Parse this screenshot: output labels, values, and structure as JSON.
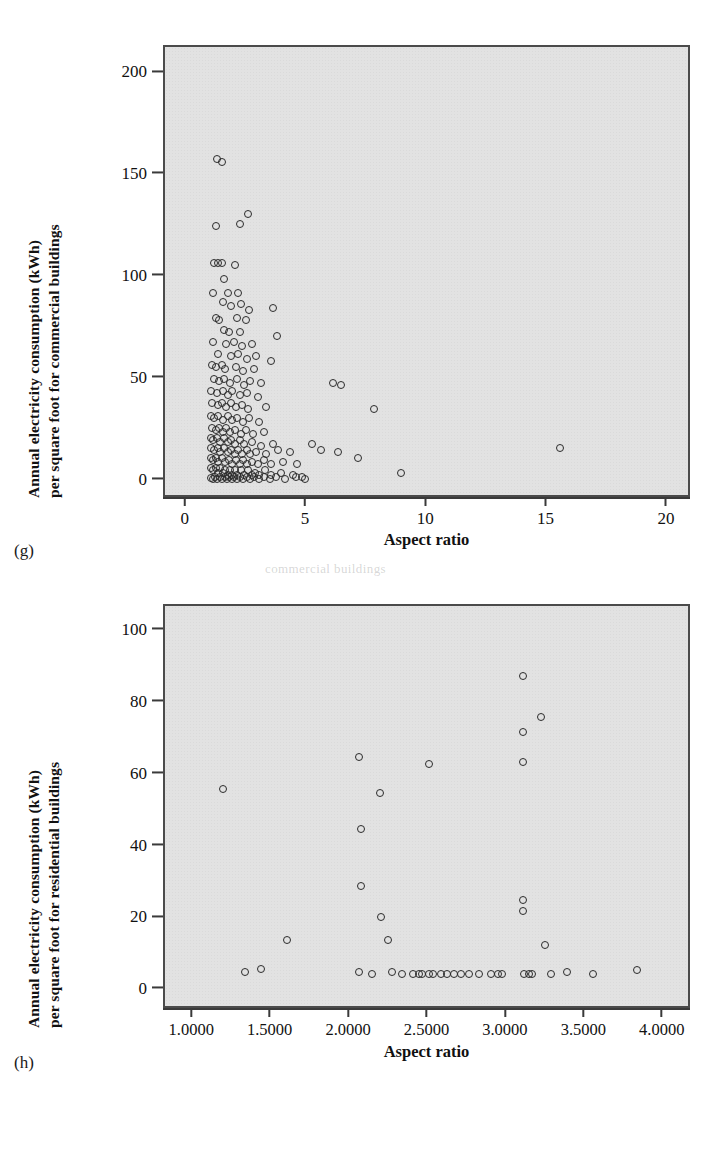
{
  "figures": [
    {
      "panel_label": "(g)",
      "ytitle_line1": "Annual electricity consumption (kWh)",
      "ytitle_line2": "per square foot for commercial buildings",
      "xtitle": "Aspect ratio",
      "yticks": [
        "0",
        "50",
        "100",
        "150",
        "200"
      ],
      "xticks": [
        "0",
        "5",
        "10",
        "15",
        "20"
      ]
    },
    {
      "panel_label": "(h)",
      "ytitle_line1": "Annual electricity consumption (kWh)",
      "ytitle_line2": "per square foot for residential buildings",
      "xtitle": "Aspect ratio",
      "yticks": [
        "0",
        "20",
        "40",
        "60",
        "80",
        "100"
      ],
      "xticks": [
        "1.0000",
        "1.5000",
        "2.0000",
        "2.5000",
        "3.0000",
        "3.5000",
        "4.0000"
      ]
    }
  ],
  "ghost_text": "commercial buildings",
  "chart_data": [
    {
      "type": "scatter",
      "panel": "(g)",
      "title": "",
      "xlabel": "Aspect ratio",
      "ylabel": "Annual electricity consumption (kWh) per square foot for commercial buildings",
      "xlim": [
        -0.9,
        21.0
      ],
      "ylim": [
        -9,
        213
      ],
      "xticks": [
        0,
        5,
        10,
        15,
        20
      ],
      "yticks": [
        0,
        50,
        100,
        150,
        200
      ],
      "grid": false,
      "legend": "none",
      "marker": "open-circle",
      "points": [
        [
          1.25,
          158
        ],
        [
          1.45,
          156.5
        ],
        [
          1.2,
          125
        ],
        [
          2.2,
          126
        ],
        [
          2.55,
          131
        ],
        [
          1.15,
          107
        ],
        [
          1.3,
          107
        ],
        [
          1.45,
          107
        ],
        [
          2.0,
          106
        ],
        [
          1.55,
          99
        ],
        [
          1.1,
          92
        ],
        [
          1.7,
          92
        ],
        [
          2.15,
          92
        ],
        [
          1.5,
          88
        ],
        [
          1.85,
          86
        ],
        [
          2.25,
          87
        ],
        [
          2.6,
          84
        ],
        [
          3.6,
          85
        ],
        [
          1.2,
          80
        ],
        [
          1.35,
          79
        ],
        [
          2.1,
          80
        ],
        [
          2.45,
          79
        ],
        [
          1.55,
          74
        ],
        [
          1.75,
          73
        ],
        [
          2.2,
          73
        ],
        [
          3.75,
          71
        ],
        [
          1.1,
          68
        ],
        [
          1.65,
          67
        ],
        [
          1.95,
          68
        ],
        [
          2.3,
          66
        ],
        [
          2.7,
          67
        ],
        [
          1.3,
          62
        ],
        [
          1.85,
          61
        ],
        [
          2.15,
          62
        ],
        [
          2.5,
          60
        ],
        [
          2.9,
          61
        ],
        [
          3.5,
          59
        ],
        [
          1.05,
          57
        ],
        [
          1.2,
          56
        ],
        [
          1.45,
          57
        ],
        [
          1.6,
          55
        ],
        [
          2.05,
          56
        ],
        [
          2.35,
          54
        ],
        [
          2.8,
          55
        ],
        [
          1.15,
          50
        ],
        [
          1.35,
          49
        ],
        [
          1.55,
          50
        ],
        [
          1.8,
          48
        ],
        [
          2.1,
          50
        ],
        [
          2.4,
          47
        ],
        [
          2.65,
          49
        ],
        [
          3.1,
          48
        ],
        [
          6.1,
          48
        ],
        [
          6.4,
          47
        ],
        [
          1.0,
          44
        ],
        [
          1.25,
          43
        ],
        [
          1.5,
          44
        ],
        [
          1.7,
          42
        ],
        [
          1.9,
          44
        ],
        [
          2.2,
          42
        ],
        [
          2.5,
          43
        ],
        [
          2.95,
          41
        ],
        [
          7.8,
          35
        ],
        [
          1.05,
          38
        ],
        [
          1.3,
          37
        ],
        [
          1.45,
          38
        ],
        [
          1.65,
          36
        ],
        [
          1.85,
          38
        ],
        [
          2.05,
          36
        ],
        [
          2.3,
          37
        ],
        [
          2.55,
          35
        ],
        [
          3.3,
          36
        ],
        [
          1.0,
          32
        ],
        [
          1.15,
          31
        ],
        [
          1.3,
          32
        ],
        [
          1.5,
          30
        ],
        [
          1.7,
          32
        ],
        [
          1.9,
          30
        ],
        [
          2.1,
          31
        ],
        [
          2.35,
          29
        ],
        [
          2.6,
          31
        ],
        [
          3.0,
          29
        ],
        [
          1.05,
          26
        ],
        [
          1.2,
          25
        ],
        [
          1.35,
          26
        ],
        [
          1.5,
          24
        ],
        [
          1.65,
          26
        ],
        [
          1.8,
          24
        ],
        [
          2.0,
          25
        ],
        [
          2.25,
          23
        ],
        [
          2.45,
          25
        ],
        [
          2.75,
          23
        ],
        [
          3.2,
          24
        ],
        [
          1.0,
          21
        ],
        [
          1.1,
          20
        ],
        [
          1.25,
          21
        ],
        [
          1.4,
          19
        ],
        [
          1.55,
          21
        ],
        [
          1.7,
          19
        ],
        [
          1.85,
          20
        ],
        [
          2.0,
          18
        ],
        [
          2.2,
          20
        ],
        [
          2.4,
          18
        ],
        [
          2.7,
          19
        ],
        [
          3.1,
          17
        ],
        [
          3.6,
          18
        ],
        [
          5.2,
          18
        ],
        [
          1.0,
          16
        ],
        [
          1.15,
          15
        ],
        [
          1.3,
          16
        ],
        [
          1.4,
          14
        ],
        [
          1.55,
          16
        ],
        [
          1.7,
          14
        ],
        [
          1.85,
          15
        ],
        [
          2.0,
          13
        ],
        [
          2.15,
          15
        ],
        [
          2.3,
          13
        ],
        [
          2.5,
          15
        ],
        [
          2.65,
          13
        ],
        [
          2.9,
          14
        ],
        [
          3.3,
          13
        ],
        [
          3.8,
          15
        ],
        [
          4.3,
          14
        ],
        [
          5.6,
          15
        ],
        [
          6.3,
          14
        ],
        [
          15.5,
          16
        ],
        [
          1.0,
          11
        ],
        [
          1.1,
          10
        ],
        [
          1.2,
          11
        ],
        [
          1.3,
          9
        ],
        [
          1.45,
          11
        ],
        [
          1.6,
          9
        ],
        [
          1.75,
          10
        ],
        [
          1.9,
          8
        ],
        [
          2.05,
          10
        ],
        [
          2.2,
          8
        ],
        [
          2.35,
          10
        ],
        [
          2.5,
          8
        ],
        [
          2.7,
          9
        ],
        [
          2.95,
          8
        ],
        [
          3.2,
          10
        ],
        [
          3.5,
          8
        ],
        [
          4.0,
          9
        ],
        [
          4.6,
          8
        ],
        [
          7.1,
          11
        ],
        [
          8.9,
          4
        ],
        [
          1.0,
          6
        ],
        [
          1.1,
          5
        ],
        [
          1.2,
          6
        ],
        [
          1.3,
          4
        ],
        [
          1.4,
          6
        ],
        [
          1.5,
          4
        ],
        [
          1.6,
          5
        ],
        [
          1.7,
          3
        ],
        [
          1.8,
          5
        ],
        [
          1.9,
          3
        ],
        [
          2.0,
          5
        ],
        [
          2.1,
          3
        ],
        [
          2.25,
          5
        ],
        [
          2.4,
          3
        ],
        [
          2.55,
          5
        ],
        [
          2.7,
          3
        ],
        [
          2.85,
          4
        ],
        [
          3.0,
          3
        ],
        [
          3.25,
          5
        ],
        [
          3.5,
          3
        ],
        [
          3.9,
          4
        ],
        [
          4.4,
          3
        ],
        [
          4.8,
          2
        ],
        [
          1.0,
          1.5
        ],
        [
          1.08,
          1
        ],
        [
          1.18,
          2
        ],
        [
          1.28,
          1
        ],
        [
          1.38,
          2
        ],
        [
          1.48,
          1
        ],
        [
          1.58,
          2
        ],
        [
          1.68,
          1
        ],
        [
          1.78,
          2
        ],
        [
          1.88,
          1
        ],
        [
          1.98,
          2
        ],
        [
          2.1,
          1
        ],
        [
          2.2,
          2
        ],
        [
          2.35,
          1
        ],
        [
          2.5,
          2
        ],
        [
          2.65,
          1
        ],
        [
          2.8,
          2
        ],
        [
          3.0,
          1
        ],
        [
          3.2,
          2
        ],
        [
          3.45,
          1
        ],
        [
          3.7,
          2
        ],
        [
          4.1,
          1
        ],
        [
          4.55,
          2
        ],
        [
          4.9,
          1
        ]
      ]
    },
    {
      "type": "scatter",
      "panel": "(h)",
      "title": "",
      "xlabel": "Aspect ratio",
      "ylabel": "Annual electricity consumption (kWh) per square foot for residential buildings",
      "xlim": [
        0.82,
        4.18
      ],
      "ylim": [
        -5.5,
        107
      ],
      "xticks": [
        1.0,
        1.5,
        2.0,
        2.5,
        3.0,
        3.5,
        4.0
      ],
      "yticks": [
        0,
        20,
        40,
        60,
        80,
        100
      ],
      "grid": false,
      "legend": "none",
      "marker": "open-circle",
      "points": [
        [
          1.19,
          56
        ],
        [
          1.33,
          5
        ],
        [
          1.43,
          6
        ],
        [
          1.6,
          14
        ],
        [
          2.06,
          65
        ],
        [
          2.07,
          45
        ],
        [
          2.07,
          29
        ],
        [
          2.06,
          5
        ],
        [
          2.14,
          4.5
        ],
        [
          2.19,
          55
        ],
        [
          2.2,
          20.5
        ],
        [
          2.24,
          14
        ],
        [
          2.27,
          5
        ],
        [
          2.33,
          4.5
        ],
        [
          2.4,
          4.5
        ],
        [
          2.44,
          4.5
        ],
        [
          2.46,
          4.5
        ],
        [
          2.5,
          63
        ],
        [
          2.5,
          4.5
        ],
        [
          2.53,
          4.5
        ],
        [
          2.58,
          4.5
        ],
        [
          2.62,
          4.5
        ],
        [
          2.66,
          4.5
        ],
        [
          2.71,
          4.5
        ],
        [
          2.76,
          4.5
        ],
        [
          2.82,
          4.5
        ],
        [
          2.9,
          4.5
        ],
        [
          2.94,
          4.5
        ],
        [
          2.97,
          4.5
        ],
        [
          3.1,
          87.5
        ],
        [
          3.1,
          72
        ],
        [
          3.1,
          63.5
        ],
        [
          3.1,
          25
        ],
        [
          3.1,
          22
        ],
        [
          3.11,
          4.5
        ],
        [
          3.14,
          4.5
        ],
        [
          3.16,
          4.5
        ],
        [
          3.22,
          76
        ],
        [
          3.24,
          12.5
        ],
        [
          3.28,
          4.5
        ],
        [
          3.38,
          5
        ],
        [
          3.55,
          4.5
        ],
        [
          3.83,
          5.5
        ]
      ]
    }
  ]
}
